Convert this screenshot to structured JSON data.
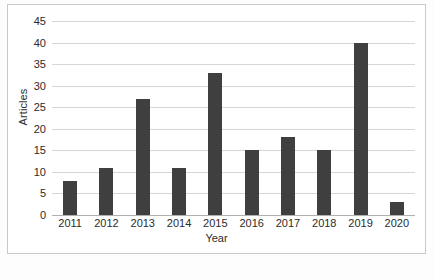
{
  "chart_data": {
    "type": "bar",
    "title": "",
    "subtitle": "",
    "xlabel": "Year",
    "ylabel": "Articles",
    "categories": [
      "2011",
      "2012",
      "2013",
      "2014",
      "2015",
      "2016",
      "2017",
      "2018",
      "2019",
      "2020"
    ],
    "values": [
      8,
      11,
      27,
      11,
      33,
      15,
      18,
      15,
      40,
      3
    ],
    "series": [
      {
        "name": "Articles",
        "values": [
          8,
          11,
          27,
          11,
          33,
          15,
          18,
          15,
          40,
          3
        ]
      }
    ],
    "ylim": [
      0,
      45
    ],
    "ytick_labels": [
      "0",
      "5",
      "10",
      "15",
      "20",
      "25",
      "30",
      "35",
      "40",
      "45"
    ],
    "ytick_values": [
      0,
      5,
      10,
      15,
      20,
      25,
      30,
      35,
      40,
      45
    ],
    "grid": true,
    "grid_axis": "y",
    "legend": false,
    "legend_position": "none",
    "bar_color": "#3f3f3f",
    "gridline_color": "#d6d6d6",
    "axis_color": "#b0b0b0",
    "background_color": "#ffffff",
    "text_color": "#2b2b2b"
  }
}
